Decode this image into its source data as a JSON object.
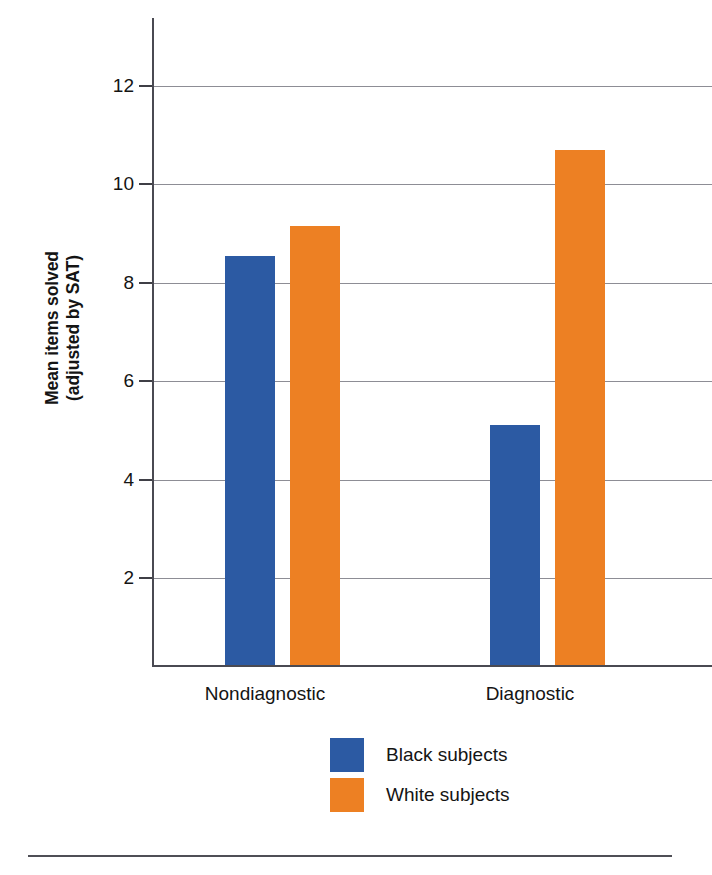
{
  "chart_data": {
    "type": "bar",
    "title": "",
    "xlabel": "",
    "ylabel": "Mean items solved\n(adjusted by SAT)",
    "ylabel_lines": [
      "Mean items solved",
      "(adjusted by SAT)"
    ],
    "categories": [
      "Nondiagnostic",
      "Diagnostic"
    ],
    "series": [
      {
        "name": "Black subjects",
        "color": "#2c5aa3",
        "values": [
          8.55,
          5.1
        ]
      },
      {
        "name": "White subjects",
        "color": "#ed8023",
        "values": [
          9.15,
          10.7
        ]
      }
    ],
    "ylim": [
      0.2,
      13.2
    ],
    "yticks": [
      2,
      4,
      6,
      8,
      10,
      12
    ],
    "ytick_labels": [
      "2",
      "4",
      "6",
      "8",
      "10",
      "12"
    ],
    "grid": "horizontal",
    "legend_position": "bottom-center"
  },
  "axis": {
    "y_title_line1": "Mean items solved",
    "y_title_line2": "(adjusted by SAT)",
    "ticks": [
      {
        "label": "12",
        "value": 12
      },
      {
        "label": "10",
        "value": 10
      },
      {
        "label": "8",
        "value": 8
      },
      {
        "label": "6",
        "value": 6
      },
      {
        "label": "4",
        "value": 4
      },
      {
        "label": "2",
        "value": 2
      }
    ]
  },
  "categories": [
    {
      "label": "Nondiagnostic"
    },
    {
      "label": "Diagnostic"
    }
  ],
  "bars": [
    {
      "name": "nondiagnostic-black",
      "series": "Black subjects",
      "category": "Nondiagnostic",
      "value": 8.55,
      "color": "#2c5aa3"
    },
    {
      "name": "nondiagnostic-white",
      "series": "White subjects",
      "category": "Nondiagnostic",
      "value": 9.15,
      "color": "#ed8023"
    },
    {
      "name": "diagnostic-black",
      "series": "Black subjects",
      "category": "Diagnostic",
      "value": 5.1,
      "color": "#2c5aa3"
    },
    {
      "name": "diagnostic-white",
      "series": "White subjects",
      "category": "Diagnostic",
      "value": 10.7,
      "color": "#ed8023"
    }
  ],
  "legend": {
    "items": [
      {
        "label": "Black subjects",
        "color": "#2c5aa3"
      },
      {
        "label": "White subjects",
        "color": "#ed8023"
      }
    ]
  },
  "colors": {
    "blue": "#2c5aa3",
    "orange": "#ed8023",
    "axis": "#4a4a52",
    "gridline": "#8d8d95",
    "text": "#141414",
    "background": "#ffffff"
  }
}
